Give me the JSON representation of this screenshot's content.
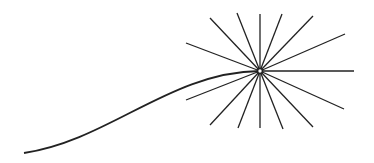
{
  "diagram": {
    "stroke_color": "#222222",
    "background": "#ffffff",
    "center": [
      260,
      71
    ],
    "curve": {
      "start": [
        24,
        153
      ],
      "c1": [
        110,
        140
      ],
      "c2": [
        170,
        72
      ],
      "end": [
        260,
        71
      ]
    },
    "spokes": [
      [
        186,
        43
      ],
      [
        210,
        18
      ],
      [
        237,
        13
      ],
      [
        260,
        14
      ],
      [
        282,
        14
      ],
      [
        313,
        16
      ],
      [
        345,
        34
      ],
      [
        354,
        71
      ],
      [
        344,
        109
      ],
      [
        313,
        127
      ],
      [
        283,
        129
      ],
      [
        260,
        128
      ],
      [
        238,
        128
      ],
      [
        210,
        125
      ],
      [
        186,
        100
      ]
    ]
  }
}
